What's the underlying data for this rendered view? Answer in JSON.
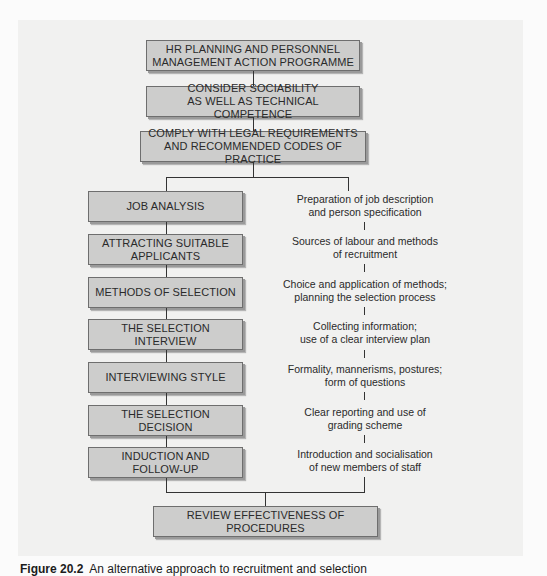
{
  "diagram": {
    "top_sequence": [
      {
        "label": "HR PLANNING AND PERSONNEL\nMANAGEMENT ACTION PROGRAMME"
      },
      {
        "label": "CONSIDER SOCIABILITY\nAS WELL AS TECHNICAL COMPETENCE"
      },
      {
        "label": "COMPLY WITH LEGAL REQUIREMENTS\nAND RECOMMENDED CODES OF PRACTICE"
      }
    ],
    "stages": [
      {
        "label": "JOB ANALYSIS",
        "note": "Preparation of job description\nand person specification"
      },
      {
        "label": "ATTRACTING SUITABLE\nAPPLICANTS",
        "note": "Sources of labour and methods\nof recruitment"
      },
      {
        "label": "METHODS OF SELECTION",
        "note": "Choice and application of methods;\nplanning the selection process"
      },
      {
        "label": "THE SELECTION INTERVIEW",
        "note": "Collecting information;\nuse of a clear interview plan"
      },
      {
        "label": "INTERVIEWING STYLE",
        "note": "Formality, mannerisms, postures;\nform of questions"
      },
      {
        "label": "THE SELECTION\nDECISION",
        "note": "Clear reporting and use of\ngrading scheme"
      },
      {
        "label": "INDUCTION AND\nFOLLOW-UP",
        "note": "Introduction and socialisation\nof new members of staff"
      }
    ],
    "final": {
      "label": "REVIEW EFFECTIVENESS OF\nPROCEDURES"
    }
  },
  "caption": {
    "number": "Figure 20.2",
    "text": "An alternative approach to recruitment and selection"
  },
  "colors": {
    "box_fill": "#cdcdcc",
    "box_border": "#6e6e6e",
    "panel_bg": "#f1f1f0",
    "line": "#333333"
  }
}
